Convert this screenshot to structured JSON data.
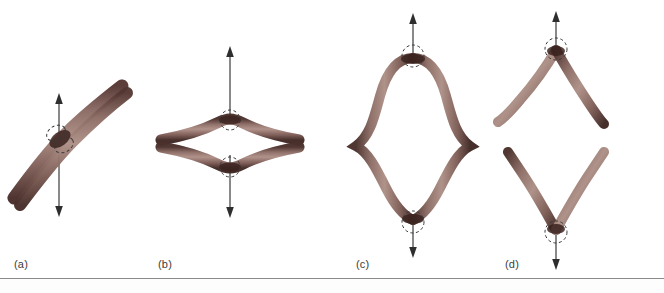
{
  "figure": {
    "background_color": "#ffffff",
    "rule_color": "#8b8b8b",
    "panel_count": 4
  },
  "colors": {
    "rod_mid": "#9c7a72",
    "rod_light": "#c4a49a",
    "rod_dark": "#5a3a35",
    "rod_edge": "#3b2420",
    "arrow": "#4a4a4a",
    "dashed_circle": "#3a3a3a",
    "label_text": "#3c3c3c"
  },
  "panels": [
    {
      "id": "a",
      "label": "(a)",
      "name": "panel-crossed-rods",
      "arrow": {
        "type": "double-headed-vertical",
        "x": 59,
        "top": 95,
        "bottom": 216
      },
      "marker_circles": 2,
      "rod_count": 2,
      "orientation": "diagonal-crossing"
    },
    {
      "id": "b",
      "label": "(b)",
      "name": "panel-lens-shape",
      "arrow": {
        "type": "double-headed-vertical",
        "x": 230,
        "top": 48,
        "bottom": 216
      },
      "marker_circles": 2,
      "rod_count": 2,
      "orientation": "horizontal-lens"
    },
    {
      "id": "c",
      "label": "(c)",
      "name": "panel-elongated-loop",
      "arrow": {
        "type": "double-headed-vertical",
        "x": 413,
        "top": 14,
        "bottom": 258
      },
      "marker_circles": 2,
      "rod_count": 2,
      "orientation": "vertical-loop-with-side-cusps"
    },
    {
      "id": "d",
      "label": "(d)",
      "name": "panel-separated-chevrons",
      "arrow": {
        "type": "double-headed-vertical-split",
        "x": 556,
        "top": 12,
        "bottom": 270
      },
      "marker_circles": 2,
      "rod_count": 2,
      "orientation": "two-separated-v-shapes"
    }
  ]
}
